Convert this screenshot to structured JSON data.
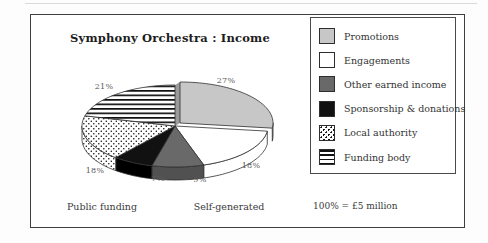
{
  "chart_data": {
    "type": "pie",
    "style": "3d-exploded",
    "title": "Symphony Orchestra : Income",
    "unit_note": "100% = £5 million",
    "start_angle_deg": 0,
    "direction": "clockwise",
    "slices": [
      {
        "label": "Promotions",
        "value": 27,
        "pct_label": "27%",
        "pattern": "solid",
        "fill": "#c7c7c7",
        "side_color": "#b0b0b0",
        "wall_color": "#9b9b9b",
        "exploded": true
      },
      {
        "label": "Engagements",
        "value": 18,
        "pct_label": "18%",
        "pattern": "solid",
        "fill": "#ffffff",
        "side_color": "#ffffff"
      },
      {
        "label": "Other earned income",
        "value": 9,
        "pct_label": "9%",
        "pattern": "solid",
        "fill": "#696969",
        "side_color": "#515151"
      },
      {
        "label": "Sponsorship & donations",
        "value": 7,
        "pct_label": "7%",
        "pattern": "solid",
        "fill": "#111111",
        "side_color": "#000000"
      },
      {
        "label": "Local authority",
        "value": 18,
        "pct_label": "18%",
        "pattern": "dots"
      },
      {
        "label": "Funding body",
        "value": 21,
        "pct_label": "21%",
        "pattern": "hlines"
      }
    ],
    "group_labels": {
      "left": "Public funding",
      "right": "Self-generated"
    },
    "legend_position": "right",
    "outline_color": "#2f2f2f"
  }
}
